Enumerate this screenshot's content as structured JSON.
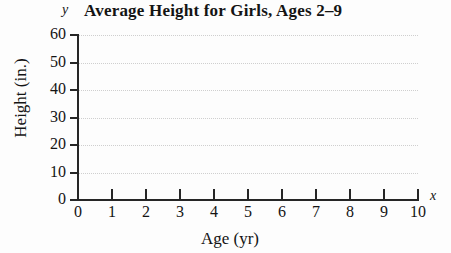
{
  "chart_data": {
    "type": "line",
    "title": "Average Height for Girls, Ages 2–9",
    "xlabel": "Age (yr)",
    "ylabel": "Height (in.)",
    "x_axis_letter": "x",
    "y_axis_letter": "y",
    "xlim": [
      0,
      10
    ],
    "ylim": [
      0,
      60
    ],
    "x_tick_labels": [
      "0",
      "1",
      "2",
      "3",
      "4",
      "5",
      "6",
      "7",
      "8",
      "9",
      "10"
    ],
    "x_ticks": [
      0,
      1,
      2,
      3,
      4,
      5,
      6,
      7,
      8,
      9,
      10
    ],
    "y_tick_labels": [
      "0",
      "10",
      "20",
      "30",
      "40",
      "50",
      "60"
    ],
    "y_ticks": [
      0,
      10,
      20,
      30,
      40,
      50,
      60
    ],
    "grid": "horizontal dotted gridlines at each y tick",
    "legend": null,
    "series": [],
    "values": [],
    "categories": [],
    "annotations": [],
    "note": "Empty grid; no data plotted in the axes region.",
    "colors": {
      "axis": "#262626",
      "gridline": "#cfcfcf",
      "text": "#141414",
      "background": "#fdfdfd"
    }
  }
}
